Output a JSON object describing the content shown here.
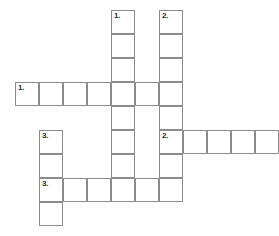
{
  "puzzle": {
    "kind": "crossword-grid",
    "cell_size": 24,
    "origin": {
      "x": 15,
      "y": 10
    },
    "columns": 11,
    "rows": 9,
    "grid_line_color": "#8c8c8c",
    "cell_fill_color": "#ffffff",
    "background_color": "#ffffff",
    "number_color": "#2b2b2b"
  },
  "entries": [
    {
      "number": "1.",
      "direction": "across",
      "row": 3,
      "col": 0,
      "length": 7
    },
    {
      "number": "2.",
      "direction": "across",
      "row": 5,
      "col": 6,
      "length": 5
    },
    {
      "number": "3.",
      "direction": "across",
      "row": 7,
      "col": 1,
      "length": 6
    },
    {
      "number": "1.",
      "direction": "down",
      "row": 0,
      "col": 4,
      "length": 8
    },
    {
      "number": "2.",
      "direction": "down",
      "row": 0,
      "col": 6,
      "length": 8
    },
    {
      "number": "3.",
      "direction": "down",
      "row": 5,
      "col": 1,
      "length": 4
    }
  ],
  "cells": [
    {
      "row": 0,
      "col": 4,
      "number": "1."
    },
    {
      "row": 0,
      "col": 6,
      "number": "2."
    },
    {
      "row": 1,
      "col": 4,
      "number": ""
    },
    {
      "row": 1,
      "col": 6,
      "number": ""
    },
    {
      "row": 2,
      "col": 4,
      "number": ""
    },
    {
      "row": 2,
      "col": 6,
      "number": ""
    },
    {
      "row": 3,
      "col": 0,
      "number": "1."
    },
    {
      "row": 3,
      "col": 1,
      "number": ""
    },
    {
      "row": 3,
      "col": 2,
      "number": ""
    },
    {
      "row": 3,
      "col": 3,
      "number": ""
    },
    {
      "row": 3,
      "col": 4,
      "number": ""
    },
    {
      "row": 3,
      "col": 5,
      "number": ""
    },
    {
      "row": 3,
      "col": 6,
      "number": ""
    },
    {
      "row": 4,
      "col": 4,
      "number": ""
    },
    {
      "row": 4,
      "col": 6,
      "number": ""
    },
    {
      "row": 5,
      "col": 1,
      "number": "3."
    },
    {
      "row": 5,
      "col": 4,
      "number": ""
    },
    {
      "row": 5,
      "col": 6,
      "number": "2."
    },
    {
      "row": 5,
      "col": 7,
      "number": ""
    },
    {
      "row": 5,
      "col": 8,
      "number": ""
    },
    {
      "row": 5,
      "col": 9,
      "number": ""
    },
    {
      "row": 5,
      "col": 10,
      "number": ""
    },
    {
      "row": 6,
      "col": 1,
      "number": ""
    },
    {
      "row": 6,
      "col": 4,
      "number": ""
    },
    {
      "row": 6,
      "col": 6,
      "number": ""
    },
    {
      "row": 7,
      "col": 1,
      "number": "3."
    },
    {
      "row": 7,
      "col": 2,
      "number": ""
    },
    {
      "row": 7,
      "col": 3,
      "number": ""
    },
    {
      "row": 7,
      "col": 4,
      "number": ""
    },
    {
      "row": 7,
      "col": 5,
      "number": ""
    },
    {
      "row": 7,
      "col": 6,
      "number": ""
    },
    {
      "row": 8,
      "col": 1,
      "number": ""
    }
  ]
}
